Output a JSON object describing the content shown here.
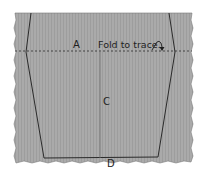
{
  "diagram": {
    "labels": {
      "a": "A",
      "fold_instruction": "Fold to trace.",
      "c": "C",
      "d": "D"
    },
    "icons": {
      "fold_arrow": "fold-arrow-icon"
    },
    "colors": {
      "paper": "#a9a9a9",
      "paper_stripe": "#9e9e9e",
      "outline": "#2b2b2b",
      "center_line": "#6e6e6e",
      "background": "#ffffff"
    }
  }
}
